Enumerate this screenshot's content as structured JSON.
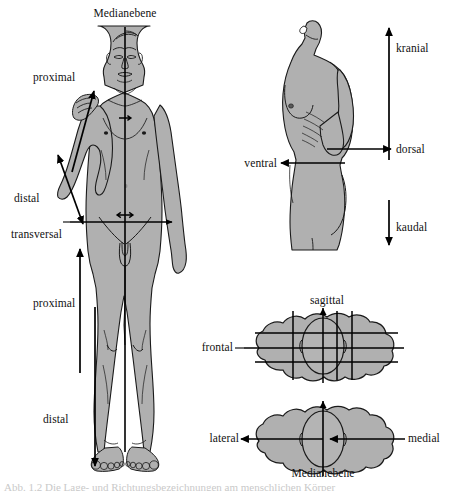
{
  "figure": {
    "background_color": "#ffffff",
    "body_fill_color": "#b0b0b0",
    "body_fill_shadow": "#9a9a9a",
    "outline_color": "#1a1a1a",
    "arrow_color": "#000000",
    "text_color": "#111111",
    "width": 451,
    "height": 491
  },
  "panels": {
    "front_figure": {
      "name": "Ganzkörper Frontalansicht",
      "labels": {
        "medianebene": "Medianebene",
        "proximal_arm": "proximal",
        "distal_arm": "distal",
        "transversal": "transversal",
        "proximal_leg": "proximal",
        "distal_leg": "distal"
      }
    },
    "lateral_figure": {
      "name": "Rumpf Seitenansicht",
      "labels": {
        "kranial": "kranial",
        "kaudal": "kaudal",
        "ventral": "ventral",
        "dorsal": "dorsal"
      }
    },
    "cross_section_top": {
      "name": "Querschnitt mit Ebenen",
      "labels": {
        "sagittal": "sagittal",
        "frontal": "frontal"
      }
    },
    "cross_section_bottom": {
      "name": "Querschnitt lateral medial",
      "labels": {
        "lateral": "lateral",
        "medial": "medial",
        "medianebene": "Medianebene"
      }
    }
  },
  "caption": {
    "cut_off_line": "Abb. 1.2  Die Lage- und Richtungsbezeichnungen am menschlichen Körper"
  }
}
